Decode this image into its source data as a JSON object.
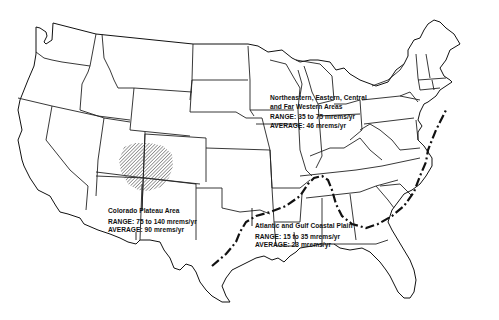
{
  "map": {
    "subject": "Background radiation dose regions of the contiguous United States",
    "colors": {
      "lines": "#111111",
      "background": "#ffffff",
      "hatch": "#555555"
    },
    "regions": [
      {
        "id": "northeastern",
        "title_line1": "Northeastern, Eastern, Central",
        "title_line2": "and Far Western Areas",
        "range": "RANGE: 35 to 75 mrems/yr",
        "average": "AVERAGE: 46 mrems/yr"
      },
      {
        "id": "colorado-plateau",
        "title": "Colorado Plateau Area",
        "range": "RANGE: 75 to 140 mrems/yr",
        "average": "AVERAGE: 90 mrems/yr"
      },
      {
        "id": "coastal-plain",
        "title": "Atlantic and Gulf Coastal Plain",
        "range": "RANGE: 15 to 35 mrems/yr",
        "average": "AVERAGE: 23 mrems/yr"
      }
    ]
  }
}
